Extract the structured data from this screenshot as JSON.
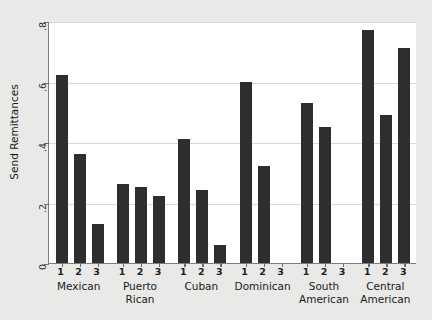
{
  "chart": {
    "type": "bar",
    "ylabel": "Send Remittances",
    "xlabel": "",
    "title": ""
  },
  "chart_data": {
    "type": "bar",
    "title": "",
    "xlabel": "",
    "ylabel": "Send Remittances",
    "ylim": [
      0,
      0.8
    ],
    "ytick_labels": [
      "0",
      ".2",
      ".4",
      ".6",
      ".8"
    ],
    "ytick_values": [
      0,
      0.2,
      0.4,
      0.6,
      0.8
    ],
    "grid": true,
    "legend": "none",
    "subgroup_labels": [
      "1",
      "2",
      "3"
    ],
    "categories": [
      "Mexican",
      "Puerto Rican",
      "Cuban",
      "Dominican",
      "South American",
      "Central American"
    ],
    "groups": [
      {
        "label": "Mexican",
        "lines": [
          "Mexican"
        ],
        "values": [
          0.62,
          0.36,
          0.13
        ]
      },
      {
        "label": "Puerto Rican",
        "lines": [
          "Puerto Rican"
        ],
        "values": [
          0.26,
          0.25,
          0.22
        ]
      },
      {
        "label": "Cuban",
        "lines": [
          "Cuban"
        ],
        "values": [
          0.41,
          0.24,
          0.06
        ]
      },
      {
        "label": "Dominican",
        "lines": [
          "Dominican"
        ],
        "values": [
          0.6,
          0.32,
          0.0
        ]
      },
      {
        "label": "South American",
        "lines": [
          "South",
          "American"
        ],
        "values": [
          0.53,
          0.45,
          0.0
        ]
      },
      {
        "label": "Central American",
        "lines": [
          "Central",
          "American"
        ],
        "values": [
          0.77,
          0.49,
          0.71
        ]
      }
    ],
    "series": [
      {
        "name": "1",
        "values": [
          0.62,
          0.26,
          0.41,
          0.6,
          0.53,
          0.77
        ]
      },
      {
        "name": "2",
        "values": [
          0.36,
          0.25,
          0.24,
          0.32,
          0.45,
          0.49
        ]
      },
      {
        "name": "3",
        "values": [
          0.13,
          0.22,
          0.06,
          0.0,
          0.0,
          0.71
        ]
      }
    ],
    "colors": {
      "bar": "#2e2e2e",
      "background": "#e9e9e7",
      "plot_background": "#ffffff",
      "grid": "#d8d8d8",
      "axis": "#7d7d7d"
    }
  }
}
